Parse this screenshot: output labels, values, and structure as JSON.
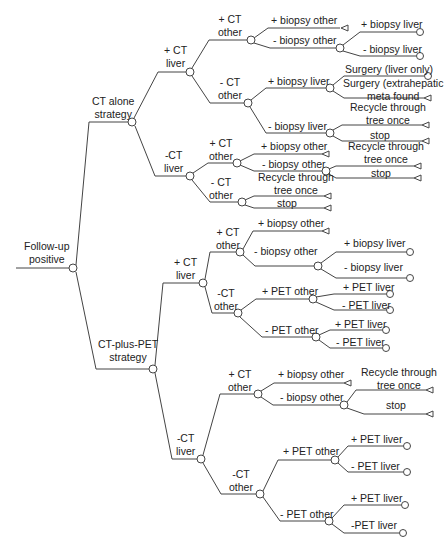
{
  "diagram": {
    "type": "decision-tree",
    "colors": {
      "line": "#444444",
      "text": "#222222",
      "background": "#ffffff"
    },
    "node_types": {
      "chance": "circle-node",
      "terminal": "triangle-node",
      "outcome": "circle-endpoint"
    }
  },
  "labels": {
    "root": "Follow-up positive",
    "root_l1": "Follow-up",
    "root_l2": "positive",
    "ct_alone_l1": "CT alone",
    "ct_alone_l2": "strategy",
    "ct_pet_l1": "CT-plus-PET",
    "ct_pet_l2": "strategy",
    "a_pos_ct_liver_l1": "+ CT",
    "a_pos_ct_liver_l2": "liver",
    "a_neg_ct_liver_l1": "-CT",
    "a_neg_ct_liver_l2": "liver",
    "a1_pos_ct_other_l1": "+ CT",
    "a1_pos_ct_other_l2": "other",
    "a1_neg_ct_other_l1": "- CT",
    "a1_neg_ct_other_l2": "other",
    "a1a_pos_biopsy_other": "+ biopsy other",
    "a1a_neg_biopsy_other": "- biopsy other",
    "a1a_pos_biopsy_liver": "+ biopsy liver",
    "a1a_neg_biopsy_liver": "- biopsy liver",
    "a1b_pos_biopsy_liver": "+ biopsy liver",
    "a1b_surgery_liver_only": "Surgery (liver only)",
    "a1b_surgery_extra_l1": "Surgery (extrahepatic",
    "a1b_surgery_extra_l2": "meta found",
    "a1b_neg_biopsy_liver": "- biopsy liver",
    "a1b_recycle_l1": "Recycle through",
    "a1b_recycle_l2": "tree once",
    "a1b_stop": "stop",
    "a2_pos_ct_other_l1": "+ CT",
    "a2_pos_ct_other_l2": "other",
    "a2_neg_ct_other_l1": "- CT",
    "a2_neg_ct_other_l2": "other",
    "a2a_pos_biopsy_other": "+ biopsy other",
    "a2a_neg_biopsy_other": "- biopsy other",
    "a2a_recycle_l1": "Recycle through",
    "a2a_recycle_l2": "tree once",
    "a2a_stop": "stop",
    "a2b_recycle_l1": "Recycle through",
    "a2b_recycle_l2": "tree once",
    "a2b_stop": "stop",
    "p_pos_ct_liver_l1": "+ CT",
    "p_pos_ct_liver_l2": "liver",
    "p_neg_ct_liver_l1": "-CT",
    "p_neg_ct_liver_l2": "liver",
    "p1_pos_ct_other_l1": "+ CT",
    "p1_pos_ct_other_l2": "other",
    "p1_neg_ct_other_l1": "-CT",
    "p1_neg_ct_other_l2": "other",
    "p1a_pos_biopsy_other": "+ biopsy other",
    "p1a_neg_biopsy_other": "- biopsy other",
    "p1a_pos_biopsy_liver": "+ biopsy liver",
    "p1a_neg_biopsy_liver": "- biopsy liver",
    "p1b_pos_pet_other": "+ PET other",
    "p1b_pos_pet_liver": "+ PET liver",
    "p1b_neg_pet_liver": "- PET liver",
    "p1b_neg_pet_other": "- PET other",
    "p1b2_pos_pet_liver": "+ PET liver",
    "p1b2_neg_pet_liver": "- PET liver",
    "p2_pos_ct_other_l1": "+ CT",
    "p2_pos_ct_other_l2": "other",
    "p2_neg_ct_other_l1": "-CT",
    "p2_neg_ct_other_l2": "other",
    "p2a_pos_biopsy_other": "+ biopsy other",
    "p2a_neg_biopsy_other": "- biopsy other",
    "p2a_recycle_l1": "Recycle through",
    "p2a_recycle_l2": "tree once",
    "p2a_stop": "stop",
    "p2b_pos_pet_other": "+ PET other",
    "p2b_pos_pet_liver": "+ PET liver",
    "p2b_neg_pet_liver": "- PET liver",
    "p2b_neg_pet_other": "- PET other",
    "p2b2_pos_pet_liver": "+ PET liver",
    "p2b2_neg_pet_liver": "-PET liver"
  }
}
